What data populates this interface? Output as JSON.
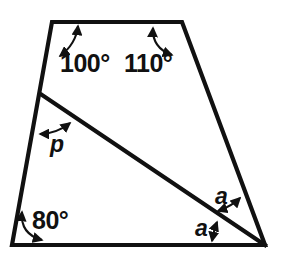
{
  "figure": {
    "background_color": "#ffffff",
    "stroke_color": "#111111",
    "vertices": {
      "top_left": [
        52,
        22
      ],
      "top_right": [
        182,
        22
      ],
      "bottom_right": [
        265,
        245
      ],
      "bottom_left": [
        12,
        245
      ],
      "diagonal_start": [
        42,
        95
      ]
    },
    "labels": {
      "angle_top_left": "100°",
      "angle_top_right": "110°",
      "angle_bottom_left": "80°",
      "angle_p": "p",
      "angle_a_upper": "a",
      "angle_a_lower": "a"
    }
  }
}
